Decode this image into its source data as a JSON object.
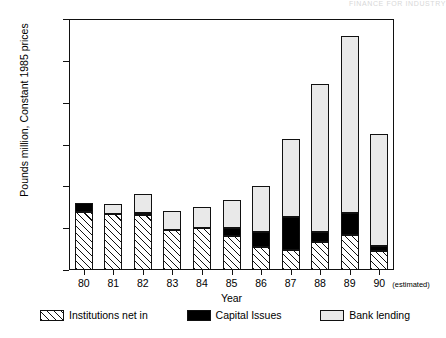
{
  "header": {
    "clipped_text": "FINANCE FOR INDUSTRY"
  },
  "chart_data": {
    "type": "bar",
    "subtype": "stacked-bar",
    "title": "",
    "xlabel": "Year",
    "ylabel": "Pounds million, Constant 1985 prices",
    "categories": [
      "80",
      "81",
      "82",
      "83",
      "84",
      "85",
      "86",
      "87",
      "88",
      "89",
      "90"
    ],
    "category_note": "(estimated)",
    "note_applies_to": "90",
    "ylim": [
      0,
      12000
    ],
    "yticks": [
      0,
      2000,
      4000,
      6000,
      8000,
      10000,
      12000
    ],
    "ytick_labels": [
      "0",
      "2000",
      "4000",
      "6000",
      "8000",
      "10000",
      "12000"
    ],
    "grid": false,
    "legend_position": "bottom",
    "series": [
      {
        "name": "Institutions net in",
        "pattern": "diagonal-hatch",
        "values": [
          2780,
          2680,
          2620,
          1890,
          1990,
          1620,
          1100,
          960,
          1340,
          1670,
          900
        ]
      },
      {
        "name": "Capital Issues",
        "pattern": "solid-black",
        "values": [
          430,
          0,
          100,
          0,
          0,
          380,
          720,
          1580,
          480,
          1050,
          240
        ]
      },
      {
        "name": "Bank lending",
        "pattern": "dotted",
        "values": [
          0,
          470,
          930,
          930,
          1020,
          1360,
          2190,
          3730,
          7080,
          8480,
          5360
        ]
      }
    ],
    "totals": [
      3210,
      3150,
      3650,
      2820,
      3010,
      3360,
      4010,
      6270,
      8900,
      11200,
      6500
    ]
  },
  "legend": {
    "items": [
      {
        "label": "Institutions net in",
        "pattern": "diagonal-hatch"
      },
      {
        "label": "Capital Issues",
        "pattern": "solid-black"
      },
      {
        "label": "Bank lending",
        "pattern": "dotted"
      }
    ]
  }
}
